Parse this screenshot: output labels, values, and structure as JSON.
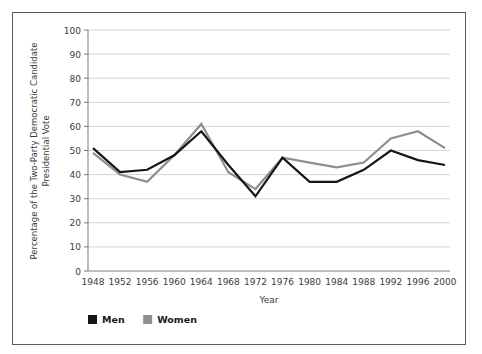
{
  "chart_data": {
    "type": "line",
    "title": "",
    "xlabel": "Year",
    "ylabel": "Percentage of the Two-Party Democratic Candidate Presidential Vote",
    "ylabel_line1": "Percentage of the Two-Party Democratic Candidate",
    "ylabel_line2": "Presidential Vote",
    "categories": [
      1948,
      1952,
      1956,
      1960,
      1964,
      1968,
      1972,
      1976,
      1980,
      1984,
      1988,
      1992,
      1996,
      2000
    ],
    "x_tick_labels": [
      "1948",
      "1952",
      "1956",
      "1960",
      "1964",
      "1968",
      "1972",
      "1976",
      "1980",
      "1984",
      "1988",
      "1992",
      "1996",
      "2000"
    ],
    "y_tick_labels": [
      "0",
      "10",
      "20",
      "30",
      "40",
      "50",
      "60",
      "70",
      "80",
      "90",
      "100"
    ],
    "y_ticks": [
      0,
      10,
      20,
      30,
      40,
      50,
      60,
      70,
      80,
      90,
      100
    ],
    "ylim": [
      0,
      100
    ],
    "grid": "horizontal",
    "legend_position": "below-left",
    "series": [
      {
        "name": "Men",
        "color": "#161616",
        "values": [
          51,
          41,
          42,
          48,
          58,
          44,
          31,
          47,
          37,
          37,
          42,
          50,
          46,
          44
        ]
      },
      {
        "name": "Women",
        "color": "#8e8e8e",
        "values": [
          49,
          40,
          37,
          48,
          61,
          41,
          34,
          47,
          45,
          43,
          45,
          55,
          58,
          51
        ]
      }
    ]
  },
  "legend": {
    "items": [
      {
        "label": "Men",
        "color": "#161616"
      },
      {
        "label": "Women",
        "color": "#8e8e8e"
      }
    ]
  },
  "colors": {
    "frame_border": "#5a5a5a",
    "axis_line": "#7a7a7a",
    "gridline": "#d4d4d4",
    "background": "#ffffff",
    "tick_text": "#3b3b3b"
  }
}
